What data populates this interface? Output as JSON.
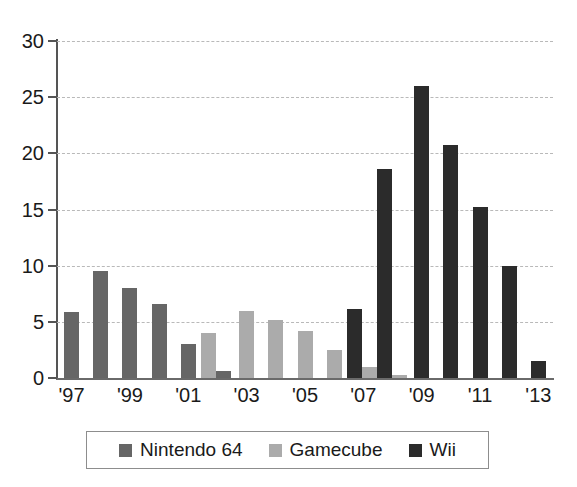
{
  "chart_data": {
    "type": "bar",
    "title": "",
    "subtitle": "",
    "xlabel": "",
    "ylabel": "",
    "grid": true,
    "legend_position": "bottom",
    "ylim": [
      0,
      30
    ],
    "yticks": [
      0,
      5,
      10,
      15,
      20,
      25,
      30
    ],
    "ytick_labels": [
      "0",
      "5",
      "10",
      "15",
      "20",
      "25",
      "30"
    ],
    "categories": [
      "1997",
      "1998",
      "1999",
      "2000",
      "2001",
      "2002",
      "2003",
      "2004",
      "2005",
      "2006",
      "2007",
      "2008",
      "2009",
      "2010",
      "2011",
      "2012",
      "2013"
    ],
    "xtick_labels": [
      "'97",
      "'99",
      "'01",
      "'03",
      "'05",
      "'07",
      "'09",
      "'11",
      "'13"
    ],
    "xtick_categories": [
      "1997",
      "1999",
      "2001",
      "2003",
      "2005",
      "2007",
      "2009",
      "2011",
      "2013"
    ],
    "series": [
      {
        "name": "Nintendo 64",
        "color": "#666666",
        "values": [
          5.9,
          9.5,
          8.0,
          6.6,
          3.0,
          0.6,
          0,
          0,
          0,
          0,
          0,
          0,
          0,
          0,
          0,
          0,
          0
        ]
      },
      {
        "name": "Gamecube",
        "color": "#ababab",
        "values": [
          0,
          0,
          0,
          0,
          0,
          4.0,
          6.0,
          5.2,
          4.2,
          2.5,
          1.0,
          0.3,
          0,
          0,
          0,
          0,
          0
        ]
      },
      {
        "name": "Wii",
        "color": "#2b2b2b",
        "values": [
          0,
          0,
          0,
          0,
          0,
          0,
          0,
          0,
          0,
          0,
          6.1,
          18.6,
          26.0,
          20.7,
          15.2,
          10.0,
          1.5
        ]
      }
    ]
  },
  "legend": {
    "items": [
      {
        "label": "Nintendo 64",
        "color": "#666666"
      },
      {
        "label": "Gamecube",
        "color": "#ababab"
      },
      {
        "label": "Wii",
        "color": "#2b2b2b"
      }
    ]
  }
}
